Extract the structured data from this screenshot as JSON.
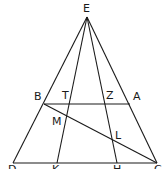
{
  "diagram": {
    "type": "geometry",
    "points": {
      "E": {
        "label": "E",
        "x": 87,
        "y": 17,
        "lx": 83,
        "ly": 12
      },
      "B": {
        "label": "B",
        "x": 44,
        "y": 104,
        "lx": 34,
        "ly": 100
      },
      "T": {
        "label": "T",
        "x": 69,
        "y": 104,
        "lx": 62,
        "ly": 99
      },
      "Z": {
        "label": "Z",
        "x": 105,
        "y": 104,
        "lx": 106,
        "ly": 99
      },
      "A": {
        "label": "A",
        "x": 130,
        "y": 104,
        "lx": 133,
        "ly": 100
      },
      "M": {
        "label": "M",
        "x": 66,
        "y": 116,
        "lx": 52,
        "ly": 125
      },
      "L": {
        "label": "L",
        "x": 113,
        "y": 144,
        "lx": 115,
        "ly": 139
      },
      "D": {
        "label": "D",
        "x": 13,
        "y": 163,
        "lx": 8,
        "ly": 173
      },
      "K": {
        "label": "K",
        "x": 57,
        "y": 163,
        "lx": 52,
        "ly": 173
      },
      "H": {
        "label": "H",
        "x": 117,
        "y": 163,
        "lx": 113,
        "ly": 173
      },
      "C": {
        "label": "C",
        "x": 157,
        "y": 163,
        "lx": 154,
        "ly": 173
      }
    },
    "segments": [
      [
        "E",
        "D"
      ],
      [
        "E",
        "K"
      ],
      [
        "E",
        "H"
      ],
      [
        "E",
        "C"
      ],
      [
        "D",
        "C"
      ],
      [
        "B",
        "A"
      ],
      [
        "B",
        "C"
      ]
    ]
  }
}
